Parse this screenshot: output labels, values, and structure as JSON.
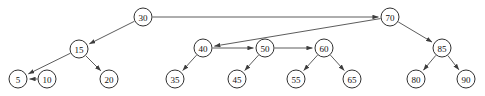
{
  "diagram": {
    "type": "directed-graph",
    "background_color": "#ffffff",
    "node_fill": "#ffffff",
    "node_stroke": "#1a1a1a",
    "edge_color": "#4a4a4a",
    "node_radius": 9
  },
  "nodes": [
    {
      "id": "n30",
      "label": "30",
      "x": 143,
      "y": 17
    },
    {
      "id": "n70",
      "label": "70",
      "x": 390,
      "y": 17
    },
    {
      "id": "n15",
      "label": "15",
      "x": 79,
      "y": 49
    },
    {
      "id": "n40",
      "label": "40",
      "x": 203,
      "y": 48
    },
    {
      "id": "n50",
      "label": "50",
      "x": 265,
      "y": 48
    },
    {
      "id": "n60",
      "label": "60",
      "x": 324,
      "y": 48
    },
    {
      "id": "n85",
      "label": "85",
      "x": 442,
      "y": 48
    },
    {
      "id": "n5",
      "label": "5",
      "x": 18,
      "y": 79
    },
    {
      "id": "n10",
      "label": "10",
      "x": 47,
      "y": 79
    },
    {
      "id": "n20",
      "label": "20",
      "x": 109,
      "y": 79
    },
    {
      "id": "n35",
      "label": "35",
      "x": 175,
      "y": 79
    },
    {
      "id": "n45",
      "label": "45",
      "x": 237,
      "y": 79
    },
    {
      "id": "n55",
      "label": "55",
      "x": 296,
      "y": 79
    },
    {
      "id": "n65",
      "label": "65",
      "x": 352,
      "y": 79
    },
    {
      "id": "n80",
      "label": "80",
      "x": 416,
      "y": 79
    },
    {
      "id": "n90",
      "label": "90",
      "x": 466,
      "y": 79
    }
  ],
  "edges": [
    {
      "id": "e-30-70",
      "from": "n30",
      "to": "n70",
      "arrow": true
    },
    {
      "id": "e-30-15",
      "from": "n30",
      "to": "n15",
      "arrow": true
    },
    {
      "id": "e-15-5",
      "from": "n15",
      "to": "n5",
      "arrow": true
    },
    {
      "id": "e-15-20",
      "from": "n15",
      "to": "n20",
      "arrow": true
    },
    {
      "id": "e-10-5",
      "from": "n10",
      "to": "n5",
      "arrow": true
    },
    {
      "id": "e-70-40",
      "from": "n70",
      "to": "n40",
      "arrow": true
    },
    {
      "id": "e-40-50",
      "from": "n40",
      "to": "n50",
      "arrow": true
    },
    {
      "id": "e-40-35",
      "from": "n40",
      "to": "n35",
      "arrow": true
    },
    {
      "id": "e-50-60",
      "from": "n50",
      "to": "n60",
      "arrow": true
    },
    {
      "id": "e-50-45",
      "from": "n50",
      "to": "n45",
      "arrow": true
    },
    {
      "id": "e-60-55",
      "from": "n60",
      "to": "n55",
      "arrow": true
    },
    {
      "id": "e-60-65",
      "from": "n60",
      "to": "n65",
      "arrow": true
    },
    {
      "id": "e-70-85",
      "from": "n70",
      "to": "n85",
      "arrow": true
    },
    {
      "id": "e-85-80",
      "from": "n85",
      "to": "n80",
      "arrow": true
    },
    {
      "id": "e-85-90",
      "from": "n85",
      "to": "n90",
      "arrow": true
    }
  ]
}
